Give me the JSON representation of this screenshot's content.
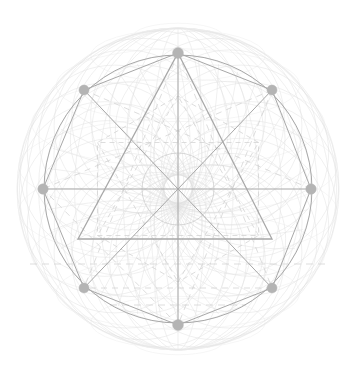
{
  "figure": {
    "title": "Sacred Geometry Mandala",
    "canvas": {
      "width": 355,
      "height": 378,
      "background": "#ffffff"
    },
    "center": {
      "x": 178,
      "y": 189
    },
    "colors": {
      "node_fill": "#b4b4b4",
      "primary_stroke": "#a8a8a8",
      "secondary_stroke": "#c8c8c8",
      "faint_stroke": "#e0e0e0",
      "very_faint_stroke": "#ececec",
      "dashed_stroke": "#cfcfcf"
    },
    "radii": {
      "hex_circumradius": 134,
      "outer_sphere": 161,
      "inner_circle": 36,
      "dashed_hexagon": 93,
      "mid_arc_ring": 118
    },
    "stroke_widths": {
      "primary": 1.3,
      "secondary": 1.0,
      "faint": 0.7,
      "hairline": 0.5
    },
    "nodes": [
      {
        "id": "node-top",
        "label": "Top Vertex",
        "x": 178,
        "y": 53,
        "angle_deg": 90,
        "size": 5.4
      },
      {
        "id": "node-upper-right",
        "label": "Upper Right Vertex",
        "x": 272,
        "y": 90,
        "angle_deg": 30,
        "size": 5.0
      },
      {
        "id": "node-right",
        "label": "Right Vertex",
        "x": 311,
        "y": 189,
        "angle_deg": 0,
        "size": 5.2
      },
      {
        "id": "node-lower-right",
        "label": "Lower Right Vertex",
        "x": 272,
        "y": 288,
        "angle_deg": -30,
        "size": 5.0
      },
      {
        "id": "node-bottom",
        "label": "Bottom Vertex",
        "x": 178,
        "y": 325,
        "angle_deg": -90,
        "size": 5.4
      },
      {
        "id": "node-lower-left",
        "label": "Lower Left Vertex",
        "x": 84,
        "y": 288,
        "angle_deg": 210,
        "size": 5.0
      },
      {
        "id": "node-left",
        "label": "Left Vertex",
        "x": 43,
        "y": 189,
        "angle_deg": 180,
        "size": 5.2
      },
      {
        "id": "node-upper-left",
        "label": "Upper Left Vertex",
        "x": 84,
        "y": 90,
        "angle_deg": 150,
        "size": 5.0
      }
    ],
    "triangle": {
      "label": "Primary Triangle",
      "apex": {
        "x": 178,
        "y": 53
      },
      "base_left": {
        "x": 78,
        "y": 239
      },
      "base_right": {
        "x": 272,
        "y": 239
      }
    },
    "dashed_horizontal_line": {
      "y": 264,
      "x1": 30,
      "x2": 326
    },
    "dashed_lower_line": {
      "y": 305,
      "x1": 110,
      "x2": 246
    },
    "axis_lines": [
      {
        "label": "Horizontal Axis",
        "x1": 43,
        "y1": 189,
        "x2": 311,
        "y2": 189
      },
      {
        "label": "Vertical Axis",
        "x1": 178,
        "y1": 53,
        "x2": 178,
        "y2": 325
      },
      {
        "label": "Diagonal A",
        "x1": 84,
        "y1": 90,
        "x2": 272,
        "y2": 288
      },
      {
        "label": "Diagonal B",
        "x1": 272,
        "y1": 90,
        "x2": 84,
        "y2": 288
      }
    ],
    "arc_counts": {
      "meridians": 18,
      "parallels": 11,
      "center_fan": 40,
      "petal_arcs": 24
    }
  }
}
